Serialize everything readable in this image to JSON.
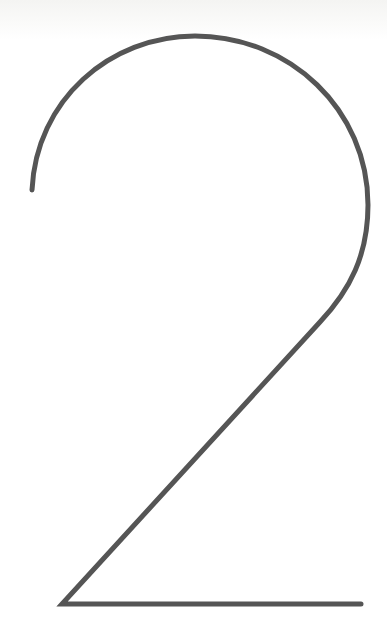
{
  "figure": {
    "glyph": "2",
    "stroke_color": "#555555",
    "stroke_width": 5,
    "background_color": "#ffffff"
  }
}
